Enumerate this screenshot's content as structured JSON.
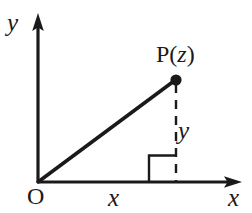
{
  "diagram": {
    "type": "coordinate-diagram",
    "background_color": "#ffffff",
    "stroke_color": "#1a1a1a",
    "axes": {
      "y_axis_label": "y",
      "x_axis_label": "x",
      "origin_label": "O",
      "y_axis_x": 38,
      "y_axis_top": 15,
      "x_axis_y": 182,
      "x_axis_right": 240
    },
    "point": {
      "label_prefix": "P(",
      "label_variable": "z",
      "label_suffix": ")",
      "full_label": "P(z)",
      "x": 176,
      "y": 80,
      "dot_radius": 5.5
    },
    "segments": {
      "real_part_label": "x",
      "imaginary_part_label": "y",
      "vector_from": [
        38,
        182
      ],
      "vector_to": [
        176,
        80
      ],
      "dashed_from": [
        176,
        85
      ],
      "dashed_to": [
        176,
        182
      ]
    },
    "right_angle_marker": {
      "present": true,
      "corner_x": 176,
      "corner_y": 182,
      "size": 27
    }
  }
}
